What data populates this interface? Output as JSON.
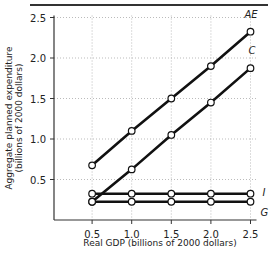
{
  "chart_data": {
    "type": "line",
    "title": "",
    "xlabel": "Real GDP (billions of 2000 dollars)",
    "ylabel_line1": "Aggregate planned expenditure",
    "ylabel_line2": "(billions of 2000 dollars)",
    "xlim": [
      0,
      2.5
    ],
    "ylim": [
      0,
      2.5
    ],
    "grid": true,
    "x_ticks": [
      "0.5",
      "1.0",
      "1.5",
      "2.0",
      "2.5"
    ],
    "y_ticks": [
      "0.5",
      "1.0",
      "1.5",
      "2.0",
      "2.5"
    ],
    "x": [
      0.5,
      1.0,
      1.5,
      2.0,
      2.5
    ],
    "series": [
      {
        "name": "AE",
        "values": [
          0.675,
          1.1,
          1.5,
          1.9,
          2.325
        ]
      },
      {
        "name": "C",
        "values": [
          0.225,
          0.625,
          1.05,
          1.45,
          1.875
        ]
      },
      {
        "name": "I",
        "values": [
          0.325,
          0.325,
          0.325,
          0.325,
          0.325
        ]
      },
      {
        "name": "G",
        "values": [
          0.225,
          0.225,
          0.225,
          0.225,
          0.225
        ]
      }
    ],
    "legend_position": "inline labels at right end of each line"
  }
}
